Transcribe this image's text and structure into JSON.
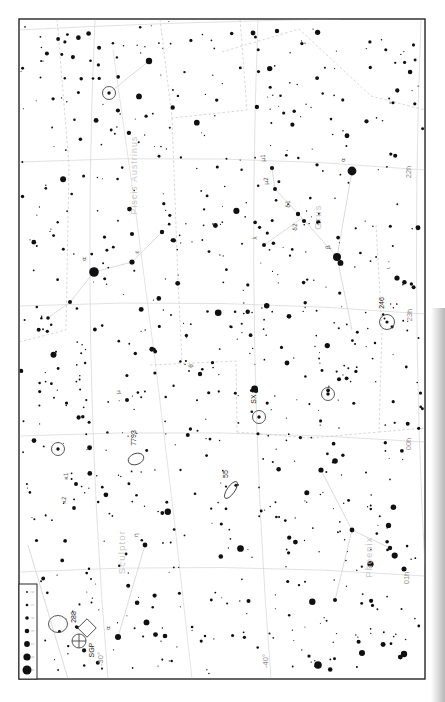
{
  "canvas": {
    "width": 445,
    "height": 702,
    "background": "#ffffff"
  },
  "frame": {
    "x": 19,
    "y": 19,
    "w": 406,
    "h": 660,
    "stroke": "#262626"
  },
  "page_shadow": {
    "x": 431,
    "y": 308,
    "w": 14,
    "h": 394
  },
  "colors": {
    "star": "#101010",
    "grid": "#cfcfcf",
    "boundary": "#c6c6c6",
    "figure": "#d2d2d2",
    "constellation_name": "#c6c6c6",
    "greek_label": "#5a5a5a",
    "object_label": "#1a1a1a",
    "coord_label": "#8c8c8c",
    "dso_stroke": "#444444",
    "legend_label": "#9a9a9a"
  },
  "ra_labels": [
    {
      "text": "22h",
      "x": 411,
      "y": 172
    },
    {
      "text": "23h",
      "x": 412,
      "y": 315
    },
    {
      "text": "00h",
      "x": 411,
      "y": 444
    },
    {
      "text": "01h",
      "x": 409,
      "y": 578
    }
  ],
  "dec_labels": [
    {
      "text": "-30°",
      "x": 103,
      "y": 659
    },
    {
      "text": "-40°",
      "x": 268,
      "y": 661
    }
  ],
  "constellation_names": [
    {
      "text": "Piscis Austrinus",
      "x": 137,
      "y": 175,
      "size": 8.5
    },
    {
      "text": "Grus",
      "x": 321,
      "y": 217,
      "size": 9.5
    },
    {
      "text": "Sculptor",
      "x": 125,
      "y": 552,
      "size": 9.5
    },
    {
      "text": "Phoenix",
      "x": 372,
      "y": 557,
      "size": 9
    }
  ],
  "grid": {
    "ra_lines": [
      "M 19,30 Q 170,22 340,19",
      "M 19,162 Q 222,152 425,170",
      "M 19,306 Q 222,297 425,314",
      "M 19,436 Q 222,427 425,442",
      "M 19,572 Q 222,561 425,576"
    ],
    "dec_lines": [
      "M 95,19 Q 80,350 108,679",
      "M 258,19 Q 245,350 271,679",
      "M 421,19 Q 408,350 432,679"
    ],
    "extra": [
      "M 113,50 Q 158,360 192,679"
    ]
  },
  "boundaries": [
    "M 57,19 L 69,165 L 66,330 L 19,342",
    "M 160,19 L 172,118 L 247,110 L 240,19",
    "M 172,118 L 178,280 L 182,362",
    "M 150,365 L 236,361 L 237,432",
    "M 222,52 L 299,29 L 371,96 L 425,110",
    "M 376,225 L 382,330 L 379,432",
    "M 237,432 L 310,438 L 379,432",
    "M 379,432 L 425,428"
  ],
  "figures": [
    "M 94,272 L 132,262 L 162,232",
    "M 94,272 L 70,302 L 48,318",
    "M 352,171 L 337,257 L 302,218 L 275,189 L 272,168",
    "M 337,257 L 352,330",
    "M 302,218 L 264,245",
    "M 118,637 L 145,545",
    "M 321,470 L 352,530 L 390,548",
    "M 352,530 L 335,600",
    "M 149,61 L 109,93",
    "M 28,545 L 68,679"
  ],
  "bright_stars": [
    {
      "x": 94,
      "y": 272,
      "r": 4.8,
      "label": "α",
      "lx": 86,
      "ly": 259
    },
    {
      "x": 132,
      "y": 262,
      "r": 2.6,
      "label": "ε",
      "lx": 139,
      "ly": 252
    },
    {
      "x": 162,
      "y": 232,
      "r": 2.2
    },
    {
      "x": 70,
      "y": 302,
      "r": 2.0
    },
    {
      "x": 48,
      "y": 318,
      "r": 1.8
    },
    {
      "x": 149,
      "y": 61,
      "r": 3.2
    },
    {
      "x": 272,
      "y": 168,
      "r": 2.1,
      "label": "μ1",
      "lx": 265,
      "ly": 158
    },
    {
      "x": 275,
      "y": 189,
      "r": 2.0,
      "label": "μ2",
      "lx": 268,
      "ly": 181
    },
    {
      "x": 298,
      "y": 214,
      "r": 2.2,
      "label": "δ1",
      "lx": 290,
      "ly": 204
    },
    {
      "x": 304,
      "y": 221,
      "r": 2.1,
      "label": "δ2",
      "lx": 297,
      "ly": 227
    },
    {
      "x": 352,
      "y": 171,
      "r": 4.4,
      "label": "α",
      "lx": 345,
      "ly": 160
    },
    {
      "x": 337,
      "y": 257,
      "r": 4.0,
      "label": "β",
      "lx": 330,
      "ly": 247
    },
    {
      "x": 264,
      "y": 245,
      "r": 2.0,
      "label": "λ",
      "lx": 257,
      "ly": 238
    },
    {
      "x": 145,
      "y": 545,
      "r": 2.4,
      "label": "η",
      "lx": 138,
      "ly": 535
    },
    {
      "x": 118,
      "y": 637,
      "r": 3.0,
      "label": "α",
      "lx": 110,
      "ly": 628
    },
    {
      "x": 127,
      "y": 400,
      "r": 2.0,
      "label": "μ",
      "lx": 120,
      "ly": 392
    },
    {
      "x": 76,
      "y": 484,
      "r": 2.0,
      "label": "κ1",
      "lx": 68,
      "ly": 476
    },
    {
      "x": 74,
      "y": 508,
      "r": 1.9,
      "label": "κ2",
      "lx": 66,
      "ly": 500
    },
    {
      "x": 200,
      "y": 374,
      "r": 2.2,
      "label": "θ",
      "lx": 193,
      "ly": 366
    },
    {
      "x": 397,
      "y": 278,
      "r": 2.6,
      "label": "ι",
      "lx": 390,
      "ly": 268
    },
    {
      "x": 318,
      "y": 665,
      "r": 3.8
    },
    {
      "x": 404,
      "y": 654,
      "r": 3.2
    },
    {
      "x": 362,
      "y": 653,
      "r": 3.0
    },
    {
      "x": 335,
      "y": 461,
      "r": 2.8
    },
    {
      "x": 287,
      "y": 363,
      "r": 2.4
    },
    {
      "x": 253,
      "y": 33,
      "r": 2.4
    },
    {
      "x": 277,
      "y": 31,
      "r": 2.2
    },
    {
      "x": 404,
      "y": 569,
      "r": 2.5
    },
    {
      "x": 321,
      "y": 470,
      "r": 2.6
    },
    {
      "x": 352,
      "y": 530,
      "r": 2.4
    },
    {
      "x": 390,
      "y": 548,
      "r": 2.2
    },
    {
      "x": 335,
      "y": 600,
      "r": 2.0
    }
  ],
  "deep_sky_objects": [
    {
      "type": "galaxy",
      "label": "7793",
      "x": 136,
      "y": 459,
      "rx": 8,
      "ry": 5.5,
      "rot": -20,
      "lx": 136,
      "ly": 438
    },
    {
      "type": "galaxy",
      "label": "55",
      "x": 231,
      "y": 490,
      "rx": 10,
      "ry": 3.8,
      "rot": -55,
      "lx": 228,
      "ly": 474
    },
    {
      "type": "planetary",
      "label": "246",
      "x": 387,
      "y": 322,
      "r": 7.5,
      "lx": 384,
      "ly": 303
    },
    {
      "type": "globular",
      "label": "288",
      "x": 79,
      "y": 641,
      "r": 7,
      "lx": 76,
      "ly": 617
    },
    {
      "type": "marker-diamond",
      "label": "SGP",
      "x": 87,
      "y": 628,
      "s": 6.5,
      "lx": 94,
      "ly": 650
    },
    {
      "type": "variable",
      "label": "SX",
      "x": 259,
      "y": 417,
      "r": 6.5,
      "lx": 256,
      "ly": 399
    },
    {
      "type": "variable",
      "label": "",
      "x": 109,
      "y": 93,
      "r": 6.5
    },
    {
      "type": "variable",
      "label": "",
      "x": 58,
      "y": 449,
      "r": 6.5
    },
    {
      "type": "variable",
      "label": "",
      "x": 328,
      "y": 394,
      "r": 6.5
    },
    {
      "type": "galaxy",
      "label": "",
      "x": 58,
      "y": 624,
      "rx": 9.5,
      "ry": 8.5,
      "rot": 0
    }
  ],
  "legend": {
    "box": {
      "x": 19,
      "y": 584,
      "w": 18,
      "h": 95
    },
    "dot_x": 27,
    "label_x": 33.5,
    "entries": [
      {
        "y": 592,
        "r": 0.9,
        "mag": "6"
      },
      {
        "y": 605,
        "r": 1.3,
        "mag": "5"
      },
      {
        "y": 618,
        "r": 1.8,
        "mag": "4"
      },
      {
        "y": 631,
        "r": 2.3,
        "mag": "3"
      },
      {
        "y": 644,
        "r": 2.9,
        "mag": "2"
      },
      {
        "y": 657,
        "r": 3.6,
        "mag": "1"
      },
      {
        "y": 670,
        "r": 4.5,
        "mag": "0"
      }
    ]
  },
  "starfield": {
    "seed": 987654321,
    "count": 780,
    "xmin": 21,
    "xmax": 423,
    "ymin": 21,
    "ymax": 676
  }
}
